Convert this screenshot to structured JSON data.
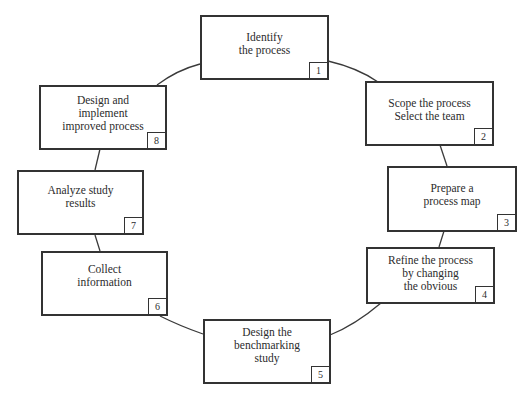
{
  "diagram": {
    "type": "cycle",
    "steps": [
      {
        "number": "1",
        "label": "Identify\nthe process"
      },
      {
        "number": "2",
        "label": "Scope the process\nSelect the team"
      },
      {
        "number": "3",
        "label": "Prepare a\nprocess map"
      },
      {
        "number": "4",
        "label": "Refine the process\nby changing\nthe obvious"
      },
      {
        "number": "5",
        "label": "Design the\nbenchmarking\nstudy"
      },
      {
        "number": "6",
        "label": "Collect\ninformation"
      },
      {
        "number": "7",
        "label": "Analyze study\nresults"
      },
      {
        "number": "8",
        "label": "Design and\nimplement\nimproved process"
      }
    ],
    "colors": {
      "stroke": "#333333",
      "text": "#2c2c2c",
      "background": "#ffffff"
    }
  }
}
